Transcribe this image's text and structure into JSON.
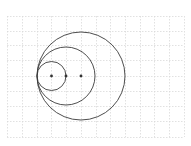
{
  "diagram": {
    "type": "tangent-circles",
    "grid": {
      "x_lines": [
        7,
        22,
        37,
        51,
        66,
        81,
        96,
        110,
        125,
        140,
        154,
        169,
        184
      ],
      "y_lines": [
        16,
        31,
        45,
        60,
        76,
        91,
        106,
        121,
        137
      ],
      "color": "#d9d9d9"
    },
    "tangent_point": {
      "x": 37,
      "y": 76
    },
    "circles": [
      {
        "name": "small-circle",
        "cx": 51.5,
        "cy": 76,
        "r": 14.5
      },
      {
        "name": "medium-circle",
        "cx": 66,
        "cy": 76,
        "r": 29
      },
      {
        "name": "large-circle",
        "cx": 81,
        "cy": 76,
        "r": 44
      }
    ],
    "center_points": [
      {
        "name": "small-circle-center",
        "x": 51.5,
        "y": 76
      },
      {
        "name": "medium-circle-center",
        "x": 66,
        "y": 76
      },
      {
        "name": "large-circle-center",
        "x": 81,
        "y": 76
      }
    ],
    "stroke_color": "#3a3a3a",
    "dot_color": "#333333"
  }
}
